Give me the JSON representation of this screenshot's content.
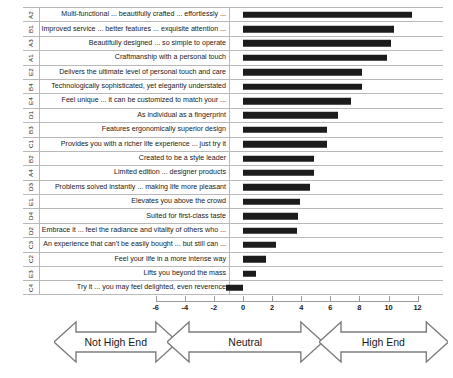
{
  "chart_data": {
    "type": "bar",
    "orientation": "horizontal",
    "title": "",
    "xlabel": "",
    "ylabel": "",
    "xlim": [
      -7,
      12
    ],
    "grid": false,
    "legend": "none",
    "zero_line": 0,
    "axis_ticks": [
      -6,
      -4,
      -2,
      0,
      2,
      4,
      6,
      8,
      10,
      12
    ],
    "categories": [
      "A2",
      "B1",
      "A3",
      "A1",
      "E2",
      "B4",
      "E4",
      "D1",
      "B3",
      "C1",
      "B2",
      "A4",
      "D3",
      "E1",
      "D4",
      "D2",
      "C3",
      "C2",
      "E3",
      "C4"
    ],
    "statements": [
      "Multi-functional ... beautifully crafted ... effortlessly ...",
      "Improved service ... better features ... exquisite attention ...",
      "Beautifully designed ... so simple to operate",
      "Craftmanship with a personal touch",
      "Delivers the ultimate level of personal touch and care",
      "Technologically sophisticated, yet elegantly understated",
      "Feel unique ... it can be customized to match your ...",
      "As individual as a fingerprint",
      "Features ergonomically superior design",
      "Provides you with a richer life experience ... just try it",
      "Created to be a style leader",
      "Limited edition ... designer products",
      "Problems solved instantly ... making life more pleasant",
      "Elevates you above the crowd",
      "Suited for first-class taste",
      "Embrace it ... feel the radiance and vitality of others who ...",
      "An experience that can't be easily bought ... but still can ...",
      "Feel your life in a more intense way",
      "Lifts you beyond the mass",
      "Try it ... you may feel delighted, even reverence"
    ],
    "values": [
      11.6,
      10.4,
      10.2,
      9.9,
      8.2,
      8.2,
      7.4,
      6.5,
      5.8,
      5.8,
      4.9,
      4.9,
      4.6,
      3.9,
      3.8,
      3.7,
      2.3,
      1.6,
      0.9,
      -1.2
    ],
    "bar_color": "#1c1c1c"
  },
  "axis": {
    "tick_labels": [
      "-6",
      "-4",
      "-2",
      "0",
      "2",
      "4",
      "6",
      "8",
      "10",
      "12"
    ]
  },
  "scale_bands": [
    {
      "label": "Not High End",
      "from": -13,
      "to": -6
    },
    {
      "label": "Neutral",
      "from": -5.2,
      "to": 4
    },
    {
      "label": "High End",
      "from": 5.2,
      "to": 12.6
    }
  ]
}
